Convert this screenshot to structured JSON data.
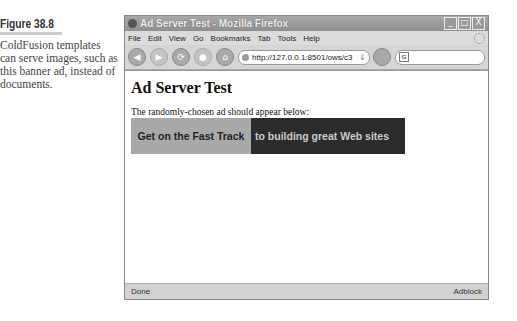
{
  "caption": {
    "figure_label": "Figure 38.8",
    "text": "ColdFusion templates can serve images, such as this banner ad, instead of documents."
  },
  "window": {
    "title": "Ad Server Test - Mozilla Firefox",
    "controls": {
      "minimize": "_",
      "maximize": "□",
      "close": "X"
    }
  },
  "menubar": {
    "items": [
      "File",
      "Edit",
      "View",
      "Go",
      "Bookmarks",
      "Tab",
      "Tools",
      "Help"
    ]
  },
  "toolbar": {
    "back": "◀",
    "forward": "▶",
    "reload": "⟳",
    "stop": "●",
    "home": "⌂",
    "url": "http://127.0.0.1:8501/ows/c3",
    "go": "⇓",
    "search_engine": "G"
  },
  "page": {
    "heading": "Ad Server Test",
    "text": "The randomly-chosen ad should appear below:",
    "banner": {
      "left_text": "Get on the Fast Track",
      "right_text": "to building great Web sites",
      "left_color": "#a9a9a9",
      "right_color": "#2b2b2b"
    }
  },
  "statusbar": {
    "status": "Done",
    "addon": "Adblock"
  }
}
